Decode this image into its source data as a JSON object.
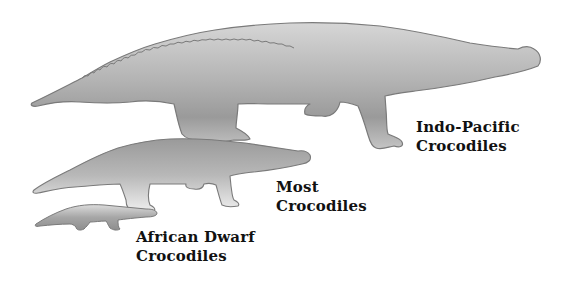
{
  "figure": {
    "type": "size-comparison-illustration",
    "colors": {
      "silhouette_top": "#c8c8c8",
      "silhouette_mid": "#a8a8a8",
      "silhouette_bottom": "#e8e8e8",
      "outline": "#7a7a7a",
      "text": "#111111",
      "background": "#ffffff"
    }
  },
  "labels": {
    "large": {
      "line1": "Indo-Pacific",
      "line2": "Crocodiles"
    },
    "medium": {
      "line1": "Most",
      "line2": "Crocodiles"
    },
    "small": {
      "line1": "African Dwarf",
      "line2": "Crocodiles"
    }
  }
}
